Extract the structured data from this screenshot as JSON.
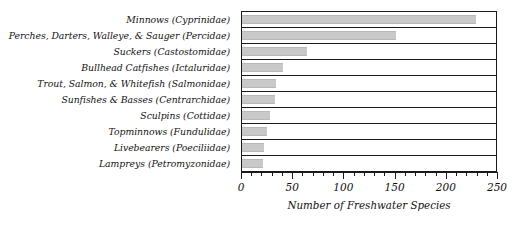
{
  "chart_data": {
    "type": "bar",
    "orientation": "horizontal",
    "title": "",
    "xlabel": "Number of Freshwater Species",
    "ylabel": "",
    "xlim": [
      0,
      250
    ],
    "xticks": [
      0,
      50,
      100,
      150,
      200,
      250
    ],
    "xtick_labels": [
      "0",
      "50",
      "100",
      "150",
      "200",
      "250"
    ],
    "minor_tick_interval": 10,
    "grid": false,
    "legend": null,
    "bar_color": "#c9c9c9",
    "frame_color": "#1a1a1a",
    "categories": [
      "Minnows (Cyprinidae)",
      "Perches, Darters, Walleye, & Sauger (Percidae)",
      "Suckers (Castostomidae)",
      "Bullhead Catfishes (Ictaluridae)",
      "Trout, Salmon, & Whitefish (Salmonidae)",
      "Sunfishes & Basses (Centrarchidae)",
      "Sculpins (Cottidae)",
      "Topminnows (Fundulidae)",
      "Livebearers (Poeciliidae)",
      "Lampreys (Petromyzonidae)"
    ],
    "values": [
      230,
      152,
      64,
      40,
      33,
      32,
      28,
      25,
      22,
      21
    ]
  }
}
